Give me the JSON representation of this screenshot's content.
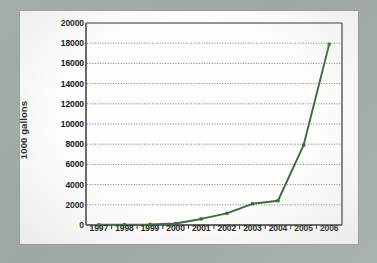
{
  "chart_data": {
    "type": "line",
    "title": "",
    "xlabel": "",
    "ylabel": "1000 gallons",
    "categories": [
      "1997",
      "1998",
      "1999",
      "2000",
      "2001",
      "2002",
      "2003",
      "2004",
      "2005",
      "2006"
    ],
    "values": [
      20,
      30,
      60,
      150,
      600,
      1150,
      2100,
      2400,
      7900,
      17900
    ],
    "ytick_labels": [
      "20000",
      "18000",
      "16000",
      "14000",
      "12000",
      "10000",
      "8000",
      "6000",
      "4000",
      "2000",
      "0"
    ],
    "ytick_values": [
      20000,
      18000,
      16000,
      14000,
      12000,
      10000,
      8000,
      6000,
      4000,
      2000,
      0
    ],
    "ylim": [
      0,
      20000
    ],
    "ytick_interval": 2000,
    "grid": "horizontal-dotted",
    "legend": "none",
    "series_color": "#3d6b3d",
    "marker": "square"
  },
  "style": {
    "page_background": "#9fa8a3",
    "card_background": "#fdfdfc",
    "axis_color": "#2b2b2b",
    "grid_color": "#6f6f6f",
    "text_color": "#131313"
  }
}
